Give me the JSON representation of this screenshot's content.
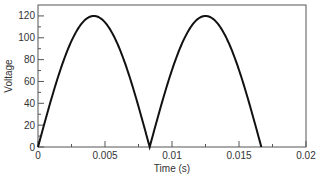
{
  "chart_data": {
    "type": "line",
    "title": "",
    "xlabel": "Time (s)",
    "ylabel": "Voltage",
    "xlim": [
      0,
      0.02
    ],
    "ylim": [
      0,
      130
    ],
    "xticks": [
      "0",
      "0.005",
      "0.01",
      "0.015",
      "0.02"
    ],
    "yticks": [
      "0",
      "20",
      "40",
      "60",
      "80",
      "100",
      "120"
    ],
    "grid": false,
    "legend": null,
    "series": [
      {
        "name": "Full-wave rectified voltage",
        "description": "|120 sin(2*pi*60*t)| for t in [0, 1/60]",
        "x": [
          0,
          0.001,
          0.002,
          0.003,
          0.004167,
          0.005,
          0.006,
          0.007,
          0.008333,
          0.009,
          0.01,
          0.011,
          0.0125,
          0.013,
          0.014,
          0.015,
          0.016667
        ],
        "y": [
          0,
          44.6,
          82.8,
          108.9,
          120,
          114.1,
          93.3,
          60.0,
          0,
          29.5,
          70.5,
          101.0,
          120,
          118.3,
          104.9,
          77.1,
          0
        ]
      }
    ]
  }
}
